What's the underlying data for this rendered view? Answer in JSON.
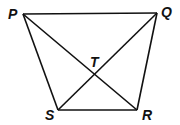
{
  "diagram": {
    "points": {
      "P": {
        "label": "P",
        "x": 23,
        "y": 14
      },
      "Q": {
        "label": "Q",
        "x": 157,
        "y": 13
      },
      "R": {
        "label": "R",
        "x": 137,
        "y": 110
      },
      "S": {
        "label": "S",
        "x": 58,
        "y": 110
      },
      "T": {
        "label": "T",
        "x": 96,
        "y": 74
      }
    },
    "segments": [
      "PQ",
      "QR",
      "RS",
      "SP",
      "PR",
      "QS"
    ],
    "colors": {
      "line": "#111111",
      "background": "#ffffff"
    }
  }
}
